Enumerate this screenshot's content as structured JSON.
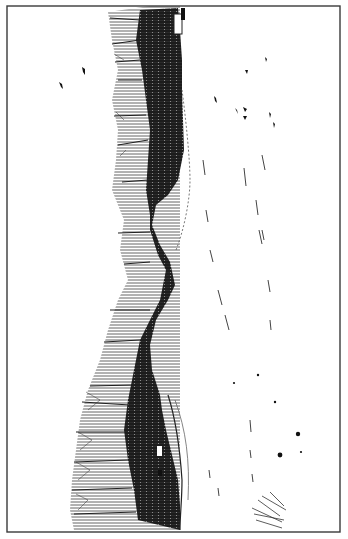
{
  "image": {
    "description": "Black-and-white engraving of a winter landscape, rotated 90 degrees: a dark band of bare trees along a snowy ridge with a white hill, a small house, and birds and tracks scattered over the snow field",
    "orientation": "rotated-90-clockwise",
    "colors": {
      "paper": "#ffffff",
      "ink": "#1a1a1a",
      "border": "#3a3a3a",
      "midtone": "#555555"
    },
    "border": {
      "left": 7,
      "top": 6,
      "right": 340,
      "bottom": 532
    },
    "elements": {
      "tree_band": "dense dark forest of bare trees along the ridge",
      "hill": "white snow-covered hill bulging into the tree band",
      "house": "small white building at top of tree band",
      "birds_left": 2,
      "birds_right": 8,
      "tracks": "scattered short dark strokes on the snow field",
      "brush_lower_right": "small clump of twigs in the lower right"
    }
  }
}
